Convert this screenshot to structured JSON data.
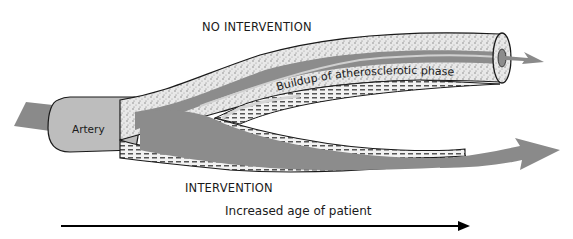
{
  "diagram": {
    "labels": {
      "no_intervention": "NO INTERVENTION",
      "intervention": "INTERVENTION",
      "buildup": "Buildup of atherosclerotic phase",
      "artery": "Artery",
      "age_axis": "Increased age of patient"
    },
    "colors": {
      "blood_flow": "#8a8a8a",
      "artery_body": "#b8b8b8",
      "lumen": "#8c8c8c",
      "lumen_highlight": "#d0d0d0",
      "wall_outline": "#1a1a1a",
      "plaque": "#e6e6e6",
      "timeline_arrow": "#000000"
    },
    "branches": [
      {
        "name": "upper",
        "condition": "NO INTERVENTION",
        "state": "thick plaque buildup, narrowed lumen"
      },
      {
        "name": "lower",
        "condition": "INTERVENTION",
        "state": "thin wall, open lumen"
      }
    ]
  }
}
